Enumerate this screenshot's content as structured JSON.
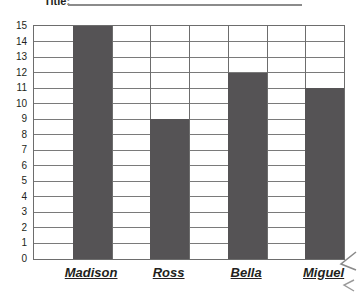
{
  "title": {
    "label": "Title:",
    "rule": "title-underline"
  },
  "chart_data": {
    "type": "bar",
    "title": "Title:",
    "xlabel": "",
    "ylabel": "",
    "categories": [
      "Madison",
      "Ross",
      "Bella",
      "Miguel"
    ],
    "values": [
      15,
      9,
      12,
      11
    ],
    "ylim": [
      0,
      15
    ],
    "ytick_labels": [
      "15",
      "14",
      "13",
      "12",
      "11",
      "10",
      "9",
      "8",
      "7",
      "6",
      "5",
      "4",
      "3",
      "2",
      "1",
      "0"
    ],
    "grid": true,
    "grid_columns": 8,
    "legend": "none",
    "bar_color": "#555355",
    "grid_color": "#7a7a7a",
    "axis_color": "#6d6d6d"
  },
  "axes": {
    "y_ticks": [
      {
        "value": "15"
      },
      {
        "value": "14"
      },
      {
        "value": "13"
      },
      {
        "value": "12"
      },
      {
        "value": "11"
      },
      {
        "value": "10"
      },
      {
        "value": "9"
      },
      {
        "value": "8"
      },
      {
        "value": "7"
      },
      {
        "value": "6"
      },
      {
        "value": "5"
      },
      {
        "value": "4"
      },
      {
        "value": "3"
      },
      {
        "value": "2"
      },
      {
        "value": "1"
      },
      {
        "value": "0"
      }
    ],
    "x_labels": [
      {
        "name": "Madison"
      },
      {
        "name": "Ross"
      },
      {
        "name": "Bella"
      },
      {
        "name": "Miguel"
      }
    ]
  },
  "icons": {
    "cursor_arrow": "cursor-arrow-icon"
  }
}
